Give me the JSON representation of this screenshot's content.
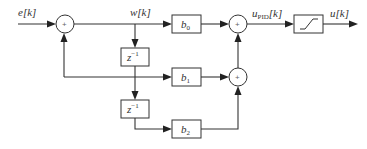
{
  "diagram": {
    "type": "block-diagram",
    "signals": {
      "input": "e[k]",
      "intermediate": "w[k]",
      "pid_output_main": "u",
      "pid_output_sub": "PID",
      "pid_output_suffix": "[k]",
      "output": "u[k]"
    },
    "blocks": {
      "b0": {
        "main": "b",
        "sub": "0"
      },
      "b1": {
        "main": "b",
        "sub": "1"
      },
      "b2": {
        "main": "b",
        "sub": "2"
      },
      "delay1": {
        "main": "z",
        "sup": "−1"
      },
      "delay2": {
        "main": "z",
        "sup": "−1"
      },
      "saturation": {
        "label": "saturation"
      }
    },
    "summing_junctions": {
      "sum1": "+",
      "sum2": "+",
      "sum3": "+"
    },
    "colors": {
      "line": "#333333",
      "background": "#ffffff"
    }
  }
}
